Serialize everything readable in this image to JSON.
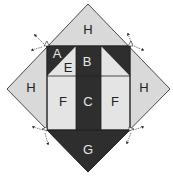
{
  "diagram": {
    "colors": {
      "dark": "#2e2e2e",
      "light": "#e4e4e4",
      "outer": "#d9d9d9",
      "line": "#222222",
      "label_on_dark": "#e8e8e8",
      "label_on_light": "#222222"
    },
    "pieces": [
      {
        "label": "H",
        "position": "top"
      },
      {
        "label": "H",
        "position": "left"
      },
      {
        "label": "H",
        "position": "right"
      },
      {
        "label": "A",
        "position": "top-left-dark-triangle"
      },
      {
        "label": "E",
        "position": "top-left-light-triangle"
      },
      {
        "label": "B",
        "position": "top-center"
      },
      {
        "label": "F",
        "position": "middle-left"
      },
      {
        "label": "C",
        "position": "center"
      },
      {
        "label": "F",
        "position": "middle-right"
      },
      {
        "label": "G",
        "position": "bottom"
      }
    ],
    "arrows": [
      {
        "name": "top-left-seam-arrows"
      },
      {
        "name": "top-right-seam-arrows"
      },
      {
        "name": "bottom-left-seam-arrows"
      },
      {
        "name": "bottom-right-seam-arrows"
      }
    ]
  }
}
